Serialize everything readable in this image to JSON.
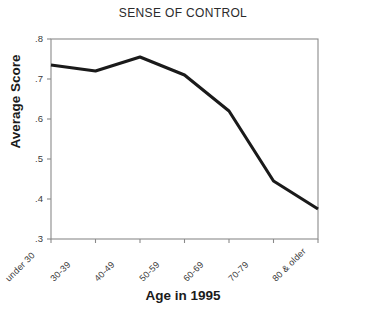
{
  "chart_data": {
    "type": "line",
    "title": "SENSE OF CONTROL",
    "xlabel": "Age in 1995",
    "ylabel": "Average Score",
    "categories": [
      "under 30",
      "30-39",
      "40-49",
      "50-59",
      "60-69",
      "70-79",
      "80 & older"
    ],
    "values": [
      0.735,
      0.72,
      0.755,
      0.71,
      0.62,
      0.445,
      0.375
    ],
    "ylim": [
      0.3,
      0.8
    ],
    "yticks": [
      0.8,
      0.7,
      0.6,
      0.5,
      0.4,
      0.3
    ],
    "ytick_labels": [
      ".8",
      ".7",
      ".6",
      ".5",
      ".4",
      ".3"
    ],
    "grid": false,
    "legend": "none",
    "line_color": "#1a1a1a",
    "axis_color": "#8a8a8a",
    "background_color": "#ffffff"
  }
}
